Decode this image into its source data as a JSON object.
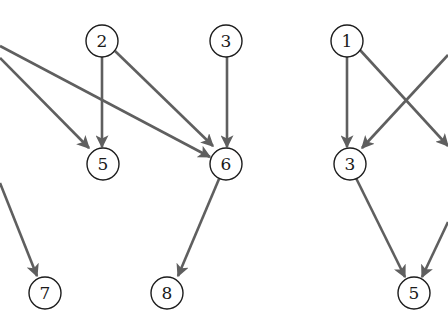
{
  "diagram": {
    "type": "directed-graph",
    "colors": {
      "edge": "#5f5f5f",
      "node_stroke": "#1c1c1c",
      "background": "#ffffff"
    },
    "left_graph": {
      "nodes": [
        {
          "id": "L2",
          "label": "2",
          "x": 102,
          "y": 41
        },
        {
          "id": "L3",
          "label": "3",
          "x": 226,
          "y": 41
        },
        {
          "id": "L5",
          "label": "5",
          "x": 103,
          "y": 164
        },
        {
          "id": "L6",
          "label": "6",
          "x": 226,
          "y": 164
        },
        {
          "id": "L7",
          "label": "7",
          "x": 45,
          "y": 293
        },
        {
          "id": "L8",
          "label": "8",
          "x": 167,
          "y": 293
        }
      ],
      "edges": [
        {
          "from": "offscreen-left",
          "to": "6"
        },
        {
          "from": "offscreen-left",
          "to": "5"
        },
        {
          "from": "offscreen-left",
          "to": "7"
        },
        {
          "from": "2",
          "to": "5"
        },
        {
          "from": "2",
          "to": "6"
        },
        {
          "from": "3",
          "to": "6"
        },
        {
          "from": "6",
          "to": "8"
        }
      ]
    },
    "right_graph": {
      "nodes": [
        {
          "id": "R1",
          "label": "1",
          "x": 347,
          "y": 41
        },
        {
          "id": "R3",
          "label": "3",
          "x": 350,
          "y": 164
        },
        {
          "id": "R5",
          "label": "5",
          "x": 414,
          "y": 293
        }
      ],
      "edges": [
        {
          "from": "1",
          "to": "3"
        },
        {
          "from": "1",
          "to": "offscreen-right"
        },
        {
          "from": "offscreen-right",
          "to": "3"
        },
        {
          "from": "3",
          "to": "5"
        },
        {
          "from": "offscreen-right",
          "to": "5"
        }
      ]
    }
  }
}
